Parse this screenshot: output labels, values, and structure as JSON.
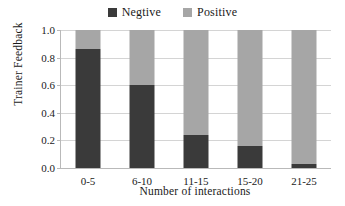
{
  "chart_data": {
    "type": "bar",
    "subtype": "stacked-100",
    "title": "",
    "xlabel": "Number of interactions",
    "ylabel": "Trainer Feedback",
    "categories": [
      "0-5",
      "6-10",
      "11-15",
      "15-20",
      "21-25"
    ],
    "series": [
      {
        "name": "Negtive",
        "color": "#3a3a3a",
        "values": [
          0.86,
          0.6,
          0.24,
          0.16,
          0.03
        ]
      },
      {
        "name": "Positive",
        "color": "#a6a6a6",
        "values": [
          0.14,
          0.4,
          0.76,
          0.84,
          0.97
        ]
      }
    ],
    "ylim": [
      0.0,
      1.0
    ],
    "yticks": [
      "1.0",
      "0.8",
      "0.6",
      "0.4",
      "0.2",
      "0.0"
    ],
    "ytick_values": [
      1.0,
      0.8,
      0.6,
      0.4,
      0.2,
      0.0
    ],
    "grid": "horizontal",
    "legend_position": "top-center",
    "axis_color": "#b9b9b9",
    "grid_color": "#d4d4d4",
    "background": "#ffffff"
  },
  "legend": {
    "items": [
      {
        "label": "Negtive",
        "color": "#3a3a3a"
      },
      {
        "label": "Positive",
        "color": "#a6a6a6"
      }
    ]
  }
}
